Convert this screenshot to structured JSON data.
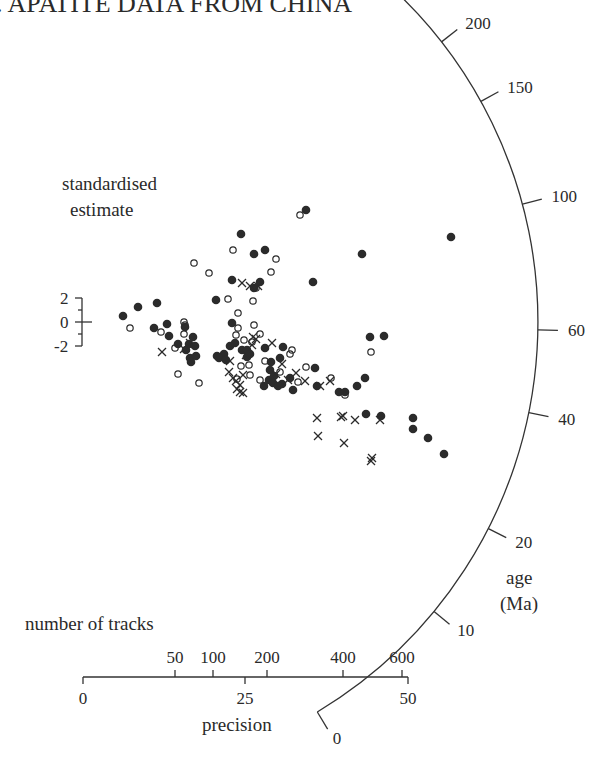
{
  "chart_data": {
    "type": "scatter",
    "subtype": "radial plot (Galbraith)",
    "title": ". APATITE DATA FROM CHINA",
    "ylabel": [
      "standardised",
      "estimate"
    ],
    "y_ticks": [
      {
        "label": "2",
        "y": 298
      },
      {
        "label": "0",
        "y": 322
      },
      {
        "label": "-2",
        "y": 346
      }
    ],
    "x_axis_precision": {
      "label": "precision",
      "ticks": [
        {
          "label": "0",
          "x": 83
        },
        {
          "label": "25",
          "x": 245
        },
        {
          "label": "50",
          "x": 408
        }
      ]
    },
    "x_axis_tracks": {
      "label": "number of tracks",
      "ticks": [
        {
          "label": "50",
          "x": 175
        },
        {
          "label": "100",
          "x": 213
        },
        {
          "label": "200",
          "x": 267
        },
        {
          "label": "400",
          "x": 343
        },
        {
          "label": "600",
          "x": 402
        }
      ]
    },
    "age_axis": {
      "label": [
        "age",
        "(Ma)"
      ],
      "ticks": [
        {
          "label": "300",
          "angle": 52.0
        },
        {
          "label": "200",
          "angle": 38.0
        },
        {
          "label": "150",
          "angle": 29.0
        },
        {
          "label": "100",
          "angle": 15.0
        },
        {
          "label": "60",
          "angle": -1.0
        },
        {
          "label": "40",
          "angle": -11.5
        },
        {
          "label": "20",
          "angle": -27.0
        },
        {
          "label": "10",
          "angle": -39.5
        },
        {
          "label": "0",
          "angle": -59.0
        }
      ]
    },
    "series": [
      {
        "name": "filled circles",
        "marker": "filled-circle",
        "points": [
          [
            123,
            316
          ],
          [
            138,
            307
          ],
          [
            157,
            303
          ],
          [
            154,
            328
          ],
          [
            167,
            324
          ],
          [
            169,
            336
          ],
          [
            178,
            344
          ],
          [
            185,
            327
          ],
          [
            186,
            350
          ],
          [
            189,
            344
          ],
          [
            193,
            337
          ],
          [
            195,
            346
          ],
          [
            190,
            358
          ],
          [
            196,
            356
          ],
          [
            191,
            362
          ],
          [
            216,
            300
          ],
          [
            217,
            356
          ],
          [
            224,
            354
          ],
          [
            230,
            346
          ],
          [
            232,
            323
          ],
          [
            241,
            234
          ],
          [
            254,
            254
          ],
          [
            265,
            250
          ],
          [
            260,
            282
          ],
          [
            232,
            280
          ],
          [
            219,
            358
          ],
          [
            226,
            360
          ],
          [
            235,
            343
          ],
          [
            242,
            350
          ],
          [
            247,
            357
          ],
          [
            247,
            350
          ],
          [
            250,
            354
          ],
          [
            264,
            386
          ],
          [
            271,
            362
          ],
          [
            270,
            370
          ],
          [
            269,
            380
          ],
          [
            274,
            376
          ],
          [
            282,
            384
          ],
          [
            293,
            390
          ],
          [
            283,
            347
          ],
          [
            254,
            288
          ],
          [
            265,
            348
          ],
          [
            273,
            383
          ],
          [
            280,
            358
          ],
          [
            306,
            210
          ],
          [
            313,
            282
          ],
          [
            315,
            368
          ],
          [
            317,
            386
          ],
          [
            339,
            392
          ],
          [
            345,
            392
          ],
          [
            357,
            386
          ],
          [
            365,
            378
          ],
          [
            370,
            337
          ],
          [
            362,
            254
          ],
          [
            384,
            336
          ],
          [
            366,
            414
          ],
          [
            381,
            416
          ],
          [
            413,
            418
          ],
          [
            413,
            429
          ],
          [
            428,
            438
          ],
          [
            444,
            454
          ],
          [
            451,
            237
          ],
          [
            278,
            386
          ],
          [
            290,
            378
          ]
        ]
      },
      {
        "name": "open circles",
        "marker": "open-circle",
        "points": [
          [
            130,
            328
          ],
          [
            161,
            332
          ],
          [
            184,
            322
          ],
          [
            185,
            325
          ],
          [
            184,
            334
          ],
          [
            175,
            348
          ],
          [
            178,
            374
          ],
          [
            199,
            383
          ],
          [
            194,
            263
          ],
          [
            209,
            273
          ],
          [
            228,
            299
          ],
          [
            233,
            250
          ],
          [
            238,
            313
          ],
          [
            238,
            328
          ],
          [
            236,
            335
          ],
          [
            241,
            366
          ],
          [
            237,
            379
          ],
          [
            253,
            301
          ],
          [
            256,
            288
          ],
          [
            252,
            342
          ],
          [
            260,
            334
          ],
          [
            265,
            361
          ],
          [
            271,
            272
          ],
          [
            276,
            259
          ],
          [
            244,
            340
          ],
          [
            254,
            325
          ],
          [
            249,
            365
          ],
          [
            260,
            380
          ],
          [
            300,
            215
          ],
          [
            292,
            350
          ],
          [
            290,
            354
          ],
          [
            298,
            382
          ],
          [
            306,
            367
          ],
          [
            331,
            378
          ],
          [
            345,
            395
          ],
          [
            371,
            352
          ],
          [
            250,
            375
          ],
          [
            280,
            372
          ]
        ]
      },
      {
        "name": "crosses",
        "marker": "cross",
        "points": [
          [
            162,
            352
          ],
          [
            184,
            349
          ],
          [
            190,
            343
          ],
          [
            242,
            283
          ],
          [
            250,
            286
          ],
          [
            258,
            286
          ],
          [
            253,
            337
          ],
          [
            256,
            339
          ],
          [
            252,
            345
          ],
          [
            246,
            355
          ],
          [
            229,
            372
          ],
          [
            233,
            378
          ],
          [
            240,
            385
          ],
          [
            240,
            392
          ],
          [
            243,
            393
          ],
          [
            237,
            389
          ],
          [
            236,
            381
          ],
          [
            243,
            375
          ],
          [
            230,
            361
          ],
          [
            272,
            343
          ],
          [
            276,
            374
          ],
          [
            282,
            364
          ],
          [
            288,
            380
          ],
          [
            296,
            373
          ],
          [
            305,
            381
          ],
          [
            320,
            386
          ],
          [
            330,
            381
          ],
          [
            317,
            418
          ],
          [
            318,
            436
          ],
          [
            341,
            417
          ],
          [
            343,
            416
          ],
          [
            344,
            443
          ],
          [
            355,
            420
          ],
          [
            371,
            461
          ],
          [
            372,
            458
          ],
          [
            380,
            420
          ]
        ]
      }
    ]
  }
}
